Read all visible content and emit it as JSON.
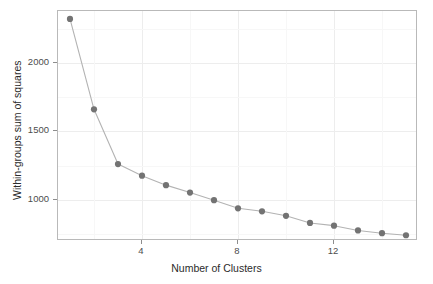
{
  "chart_data": {
    "type": "line",
    "title": "",
    "xlabel": "Number of Clusters",
    "ylabel": "Within-groups sum of squares",
    "x": [
      1,
      2,
      3,
      4,
      5,
      6,
      7,
      8,
      9,
      10,
      11,
      12,
      13,
      14,
      15
    ],
    "values": [
      2322,
      1662,
      1262,
      1177,
      1108,
      1054,
      998,
      939,
      917,
      884,
      832,
      812,
      777,
      757,
      742
    ],
    "series": [
      {
        "name": "Within-groups sum of squares",
        "values": [
          2322,
          1662,
          1262,
          1177,
          1108,
          1054,
          998,
          939,
          917,
          884,
          832,
          812,
          777,
          757,
          742
        ]
      }
    ],
    "xlim": [
      0.5,
      15.5
    ],
    "ylim": [
      700,
      2380
    ],
    "xticks": [
      4,
      8,
      12
    ],
    "xtick_labels": [
      "4",
      "8",
      "12"
    ],
    "yticks": [
      1000,
      1500,
      2000
    ],
    "ytick_labels": [
      "1000",
      "1500",
      "2000"
    ],
    "grid": true,
    "legend": "none",
    "marker": "circle",
    "point_color": "#737373",
    "line_color": "#b0b0b0",
    "panel_background": "#ffffff",
    "grid_color": "#f0f0f0",
    "axis_text_color": "#4d4d4d"
  },
  "axes": {
    "x_title": "Number of Clusters",
    "y_title": "Within-groups sum of squares"
  }
}
